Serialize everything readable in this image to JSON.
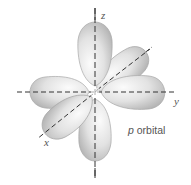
{
  "diagram": {
    "title": "p orbital",
    "caption_prefix": "p",
    "caption_suffix": " orbital",
    "axes": [
      {
        "name": "z",
        "direction": "vertical"
      },
      {
        "name": "y",
        "direction": "horizontal"
      },
      {
        "name": "x",
        "direction": "diagonal"
      }
    ],
    "lobes": [
      {
        "axis": "z",
        "side": "positive"
      },
      {
        "axis": "z",
        "side": "negative"
      },
      {
        "axis": "y",
        "side": "positive"
      },
      {
        "axis": "y",
        "side": "negative"
      },
      {
        "axis": "x",
        "side": "positive"
      },
      {
        "axis": "x",
        "side": "negative"
      }
    ],
    "colors": {
      "lobe_fill_light": "#f4f4f4",
      "lobe_fill_dark": "#b9b9b9",
      "lobe_stroke": "#a8a8a8",
      "axis": "#333333",
      "text": "#555555"
    }
  }
}
